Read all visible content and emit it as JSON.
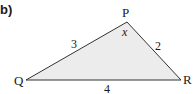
{
  "part_label": "b)",
  "triangle": {
    "fill": "#ececec",
    "stroke": "#333333",
    "vertices": {
      "P": {
        "label": "P"
      },
      "Q": {
        "label": "Q"
      },
      "R": {
        "label": "R"
      }
    },
    "sides": {
      "PQ": "3",
      "PR": "2",
      "QR": "4"
    },
    "angle_P": "x"
  }
}
